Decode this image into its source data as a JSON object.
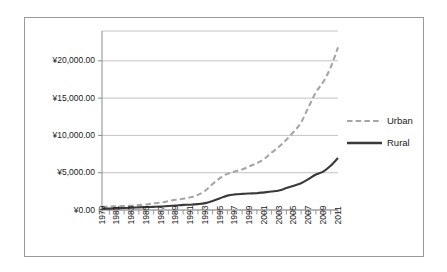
{
  "chart_data": {
    "type": "line",
    "title": "",
    "subtitle": "",
    "xlabel": "",
    "ylabel": "",
    "currency_symbol": "¥",
    "grid": true,
    "legend_position": "right",
    "xlim": [
      1979,
      2011
    ],
    "ylim": [
      0,
      24000
    ],
    "ytick_labels": [
      "¥20,000.00",
      "¥15,000.00",
      "¥10,000.00",
      "¥5,000.00",
      "¥0.00"
    ],
    "ytick_values": [
      20000,
      15000,
      10000,
      5000,
      0
    ],
    "xtick_labels": [
      "1979",
      "1981",
      "1983",
      "1985",
      "1987",
      "1989",
      "1991",
      "1993",
      "1995",
      "1997",
      "1999",
      "2001",
      "2003",
      "2005",
      "2007",
      "2009",
      "2011"
    ],
    "x": [
      1979,
      1980,
      1981,
      1982,
      1983,
      1984,
      1985,
      1986,
      1987,
      1988,
      1989,
      1990,
      1991,
      1992,
      1993,
      1994,
      1995,
      1996,
      1997,
      1998,
      1999,
      2000,
      2001,
      2002,
      2003,
      2004,
      2005,
      2006,
      2007,
      2008,
      2009,
      2010,
      2011
    ],
    "series": [
      {
        "name": "Urban",
        "color": "#a6a6a6",
        "style": "dashed",
        "values": [
          405,
          478,
          500,
          535,
          565,
          660,
          740,
          900,
          1002,
          1181,
          1376,
          1510,
          1700,
          2027,
          2577,
          3496,
          4283,
          4839,
          5160,
          5425,
          5854,
          6280,
          6860,
          7703,
          8472,
          9422,
          10493,
          11759,
          13786,
          15781,
          17175,
          19109,
          21810
        ]
      },
      {
        "name": "Rural",
        "color": "#3a3a3a",
        "style": "solid",
        "values": [
          160,
          191,
          223,
          270,
          310,
          355,
          398,
          424,
          463,
          545,
          602,
          686,
          709,
          784,
          922,
          1221,
          1578,
          1926,
          2090,
          2162,
          2210,
          2253,
          2366,
          2476,
          2622,
          2936,
          3255,
          3587,
          4140,
          4761,
          5153,
          5919,
          6977
        ]
      }
    ],
    "legend": [
      {
        "label": "Urban",
        "color": "#a6a6a6",
        "style": "dashed"
      },
      {
        "label": "Rural",
        "color": "#3a3a3a",
        "style": "solid"
      }
    ]
  },
  "style": {
    "frame_color": "#9a9a9a",
    "grid_color": "#b5b5b5",
    "axis_color": "#8c8c8c",
    "text_color": "#1a1a1a",
    "background": "#ffffff"
  }
}
